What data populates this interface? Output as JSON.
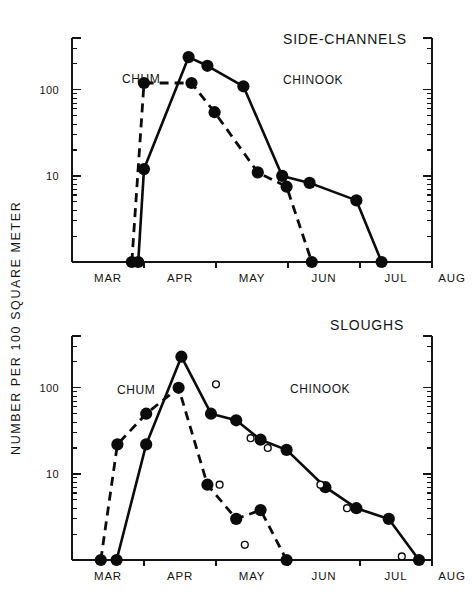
{
  "figure": {
    "y_axis_title": "NUMBER  PER  100  SQUARE  METER",
    "panels": [
      {
        "id": "side-channels",
        "title": "SIDE-CHANNELS",
        "chum_label": "CHUM",
        "chinook_label": "CHINOOK"
      },
      {
        "id": "sloughs",
        "title": "SLOUGHS",
        "chum_label": "CHUM",
        "chinook_label": "CHINOOK"
      }
    ],
    "y_tick_labels": [
      "100",
      "10"
    ],
    "month_labels": [
      "MAR",
      "APR",
      "MAY",
      "JUN",
      "JUL",
      "AUG"
    ]
  },
  "chart_data": [
    {
      "type": "line",
      "id": "side-channels",
      "title": "SIDE-CHANNELS",
      "xlabel": "",
      "ylabel": "NUMBER PER 100 SQUARE METER",
      "yscale": "log",
      "ylim": [
        1,
        400
      ],
      "y_ticks": [
        10,
        100
      ],
      "y_tick_labels": [
        "10",
        "100"
      ],
      "grid": false,
      "xlim": [
        0,
        5
      ],
      "x_tick_labels": [
        "MAR",
        "APR",
        "MAY",
        "JUN",
        "JUL",
        "AUG"
      ],
      "x_tick_positions": [
        0,
        1,
        2,
        3,
        4,
        5
      ],
      "legend_position": "inline-annotations",
      "series": [
        {
          "name": "CHUM",
          "style": "dashed",
          "marker": "filled-circle",
          "points": [
            {
              "x": 0.83,
              "y": 1.0
            },
            {
              "x": 1.0,
              "y": 120
            },
            {
              "x": 1.66,
              "y": 120
            },
            {
              "x": 1.98,
              "y": 55
            },
            {
              "x": 2.58,
              "y": 11
            },
            {
              "x": 2.98,
              "y": 7.5
            },
            {
              "x": 3.33,
              "y": 1.0
            }
          ]
        },
        {
          "name": "CHINOOK",
          "style": "solid",
          "marker": "filled-circle",
          "points": [
            {
              "x": 0.92,
              "y": 1.0
            },
            {
              "x": 1.0,
              "y": 12
            },
            {
              "x": 1.62,
              "y": 240
            },
            {
              "x": 1.88,
              "y": 190
            },
            {
              "x": 2.38,
              "y": 110
            },
            {
              "x": 2.92,
              "y": 10
            },
            {
              "x": 3.3,
              "y": 8.3
            },
            {
              "x": 3.95,
              "y": 5.2
            },
            {
              "x": 4.3,
              "y": 1.0
            }
          ]
        }
      ]
    },
    {
      "type": "line",
      "id": "sloughs",
      "title": "SLOUGHS",
      "xlabel": "",
      "ylabel": "NUMBER PER 100 SQUARE METER",
      "yscale": "log",
      "ylim": [
        1,
        400
      ],
      "y_ticks": [
        10,
        100
      ],
      "y_tick_labels": [
        "10",
        "100"
      ],
      "grid": false,
      "xlim": [
        0,
        5
      ],
      "x_tick_labels": [
        "MAR",
        "APR",
        "MAY",
        "JUN",
        "JUL",
        "AUG"
      ],
      "x_tick_positions": [
        0,
        1,
        2,
        3,
        4,
        5
      ],
      "legend_position": "inline-annotations",
      "series": [
        {
          "name": "CHUM",
          "style": "dashed",
          "marker": "filled-circle",
          "points": [
            {
              "x": 0.4,
              "y": 1.0
            },
            {
              "x": 0.63,
              "y": 22
            },
            {
              "x": 1.03,
              "y": 50
            },
            {
              "x": 1.48,
              "y": 100
            },
            {
              "x": 1.88,
              "y": 7.5
            },
            {
              "x": 2.28,
              "y": 3.0
            },
            {
              "x": 2.62,
              "y": 3.8
            },
            {
              "x": 2.98,
              "y": 1.0
            }
          ]
        },
        {
          "name": "CHINOOK",
          "style": "solid",
          "marker": "filled-circle",
          "points": [
            {
              "x": 0.62,
              "y": 1.0
            },
            {
              "x": 1.03,
              "y": 22
            },
            {
              "x": 1.52,
              "y": 230
            },
            {
              "x": 1.93,
              "y": 50
            },
            {
              "x": 2.28,
              "y": 42
            },
            {
              "x": 2.62,
              "y": 25
            },
            {
              "x": 2.98,
              "y": 19
            },
            {
              "x": 3.52,
              "y": 7.0
            },
            {
              "x": 3.95,
              "y": 4.0
            },
            {
              "x": 4.4,
              "y": 3.0
            },
            {
              "x": 4.82,
              "y": 1.0
            }
          ]
        },
        {
          "name": "CHINOOK-open",
          "style": "none",
          "marker": "open-circle",
          "points": [
            {
              "x": 2.0,
              "y": 110
            },
            {
              "x": 2.48,
              "y": 26
            },
            {
              "x": 2.72,
              "y": 20
            },
            {
              "x": 2.05,
              "y": 7.5
            },
            {
              "x": 2.4,
              "y": 1.5
            },
            {
              "x": 3.45,
              "y": 7.5
            },
            {
              "x": 3.82,
              "y": 4.0
            },
            {
              "x": 4.58,
              "y": 1.1
            }
          ]
        }
      ]
    }
  ]
}
